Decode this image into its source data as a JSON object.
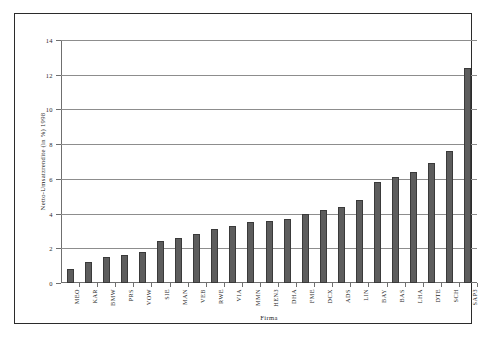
{
  "chart_data": {
    "type": "bar",
    "title": "",
    "xlabel": "Firma",
    "ylabel": "Netto-Umsatzrendite (in %) 1998",
    "ylim": [
      0,
      14
    ],
    "yticks": [
      0,
      2,
      4,
      6,
      8,
      10,
      12,
      14
    ],
    "ytick_labels": [
      "0",
      "2",
      "4",
      "6",
      "8",
      "10",
      "12",
      "14"
    ],
    "grid": true,
    "legend": "none",
    "bar_color": "#5d5d5d",
    "categories": [
      "MEO",
      "KAR",
      "BMW",
      "PRS",
      "VOW",
      "SIE",
      "MAN",
      "VEB",
      "RWE",
      "VIA",
      "MMN",
      "HEN3",
      "DHA",
      "FME",
      "DCX",
      "ADS",
      "LIN",
      "BAY",
      "BAS",
      "LHA",
      "DTE",
      "SCH",
      "SAP3"
    ],
    "values": [
      0.8,
      1.2,
      1.5,
      1.6,
      1.8,
      2.4,
      2.6,
      2.8,
      3.1,
      3.3,
      3.5,
      3.6,
      3.7,
      4.0,
      4.2,
      4.4,
      4.8,
      5.8,
      6.1,
      6.4,
      6.9,
      7.6,
      12.4
    ]
  }
}
